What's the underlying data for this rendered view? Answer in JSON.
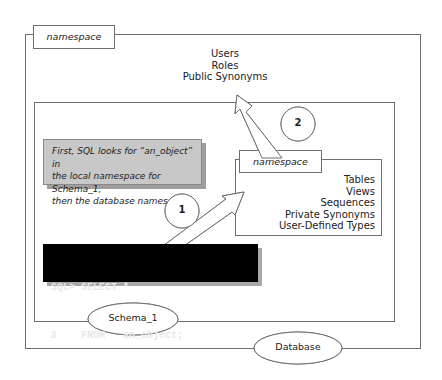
{
  "database_namespace": {
    "tab_label": "namespace",
    "items": [
      "Users",
      "Roles",
      "Public Synonyms"
    ],
    "ellipse_label": "Database"
  },
  "schema_namespace": {
    "tab_label": "namespace",
    "items": [
      "Tables",
      "Views",
      "Sequences",
      "Private Synonyms",
      "User-Defined Types"
    ],
    "ellipse_label": "Schema_1"
  },
  "callout": {
    "lines": [
      "First, SQL looks for “an_object” in",
      "the local namespace for Schema_1,",
      "then the database namespace."
    ]
  },
  "sql": {
    "lines": [
      "SQL> SELECT *",
      "2    FROM   an_object;"
    ]
  },
  "steps": {
    "step1": "1",
    "step2": "2"
  },
  "colors": {
    "line": "#6e6e6e",
    "callout_bg": "#c8c8c8",
    "sql_bg": "#000000",
    "sql_text": "#e8e8e8"
  }
}
